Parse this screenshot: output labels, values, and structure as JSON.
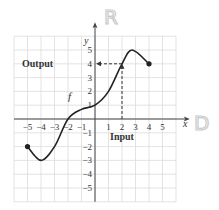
{
  "chart_data": {
    "type": "line",
    "title": "",
    "xlabel": "x",
    "ylabel": "y",
    "xlim": [
      -6,
      6
    ],
    "ylim": [
      -6,
      6
    ],
    "grid": true,
    "x_ticks": [
      "-5",
      "-4",
      "-3",
      "-2",
      "-1",
      "1",
      "2",
      "3",
      "4",
      "5"
    ],
    "y_ticks": [
      "5",
      "4",
      "3",
      "2",
      "1",
      "-1",
      "-2",
      "-3",
      "-4",
      "-5"
    ],
    "series": [
      {
        "name": "f",
        "x": [
          -5,
          -4,
          -3,
          -2,
          -1,
          0,
          1,
          2,
          2.75,
          4
        ],
        "values": [
          -2,
          -3,
          -2,
          0,
          0.7,
          1,
          2,
          4,
          5,
          4
        ],
        "endpoints": [
          {
            "x": -5,
            "y": -2,
            "closed": true
          },
          {
            "x": 4,
            "y": 4,
            "closed": true
          }
        ]
      }
    ],
    "annotations": [
      {
        "text": "Output",
        "target": {
          "x": 0,
          "y": 4
        },
        "style": "dashed arrow to y-axis"
      },
      {
        "text": "Input",
        "target": {
          "x": 2,
          "y": 0
        },
        "style": "dashed line from x-axis to curve"
      },
      {
        "text": "f",
        "position": {
          "x": -1.8,
          "y": 1.4
        }
      },
      {
        "text": "R",
        "position": "beside y-axis top",
        "style": "handwritten"
      },
      {
        "text": "D",
        "position": "beside x-axis right",
        "style": "handwritten"
      }
    ]
  },
  "labels": {
    "y_axis": "y",
    "x_axis": "x",
    "function": "f",
    "output": "Output",
    "input": "Input",
    "range_mark": "R",
    "domain_mark": "D"
  },
  "colors": {
    "grid": "#dcdcdc",
    "axis": "#444444",
    "curve": "#222222",
    "handwriting": "#c8c8c8"
  }
}
